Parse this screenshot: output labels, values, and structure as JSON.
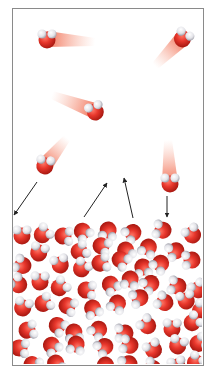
{
  "diagram": {
    "frame": {
      "x": 12,
      "y": 8,
      "width": 190,
      "height": 356,
      "border_color": "#8a8a8a"
    },
    "colors": {
      "oxygen": "#e8372c",
      "oxygen_dark": "#b81e16",
      "hydrogen": "#e6e6ea",
      "trail": "#f07a5a",
      "arrow": "#222222"
    },
    "gas_molecules": [
      {
        "x": 47,
        "y": 39,
        "trail_to": [
          95,
          42
        ],
        "rot": 0
      },
      {
        "x": 183,
        "y": 38,
        "trail_to": [
          155,
          66
        ],
        "rot": 30
      },
      {
        "x": 95,
        "y": 111,
        "trail_to": [
          52,
          95
        ],
        "rot": -20
      },
      {
        "x": 45,
        "y": 165,
        "trail_to": [
          67,
          138
        ],
        "rot": 10
      },
      {
        "x": 170,
        "y": 183,
        "trail_to": [
          168,
          140
        ],
        "rot": 0
      }
    ],
    "arrows": [
      {
        "x1": 37,
        "y1": 182,
        "x2": 14,
        "y2": 215
      },
      {
        "x1": 84,
        "y1": 217,
        "x2": 107,
        "y2": 183
      },
      {
        "x1": 133,
        "y1": 218,
        "x2": 124,
        "y2": 178
      },
      {
        "x1": 167,
        "y1": 196,
        "x2": 167,
        "y2": 217
      }
    ],
    "liquid_molecules": [
      [
        22,
        235
      ],
      [
        43,
        234
      ],
      [
        64,
        236
      ],
      [
        83,
        232
      ],
      [
        108,
        231
      ],
      [
        132,
        233
      ],
      [
        162,
        230
      ],
      [
        192,
        234
      ],
      [
        39,
        252
      ],
      [
        80,
        251
      ],
      [
        102,
        246
      ],
      [
        126,
        251
      ],
      [
        148,
        248
      ],
      [
        175,
        251
      ],
      [
        22,
        265
      ],
      [
        60,
        264
      ],
      [
        82,
        268
      ],
      [
        101,
        263
      ],
      [
        121,
        260
      ],
      [
        143,
        268
      ],
      [
        160,
        264
      ],
      [
        191,
        260
      ],
      [
        18,
        284
      ],
      [
        40,
        281
      ],
      [
        60,
        287
      ],
      [
        87,
        290
      ],
      [
        111,
        285
      ],
      [
        130,
        280
      ],
      [
        150,
        284
      ],
      [
        177,
        286
      ],
      [
        198,
        289
      ],
      [
        23,
        307
      ],
      [
        44,
        303
      ],
      [
        68,
        306
      ],
      [
        93,
        309
      ],
      [
        117,
        304
      ],
      [
        139,
        298
      ],
      [
        164,
        302
      ],
      [
        186,
        300
      ],
      [
        201,
        310
      ],
      [
        28,
        330
      ],
      [
        58,
        326
      ],
      [
        74,
        333
      ],
      [
        98,
        330
      ],
      [
        124,
        333
      ],
      [
        147,
        325
      ],
      [
        172,
        328
      ],
      [
        193,
        322
      ],
      [
        20,
        348
      ],
      [
        52,
        346
      ],
      [
        76,
        345
      ],
      [
        104,
        347
      ],
      [
        129,
        345
      ],
      [
        153,
        349
      ],
      [
        178,
        345
      ],
      [
        199,
        343
      ],
      [
        33,
        365
      ],
      [
        56,
        364
      ],
      [
        105,
        366
      ],
      [
        128,
        364
      ],
      [
        152,
        368
      ],
      [
        177,
        366
      ],
      [
        196,
        362
      ]
    ]
  }
}
